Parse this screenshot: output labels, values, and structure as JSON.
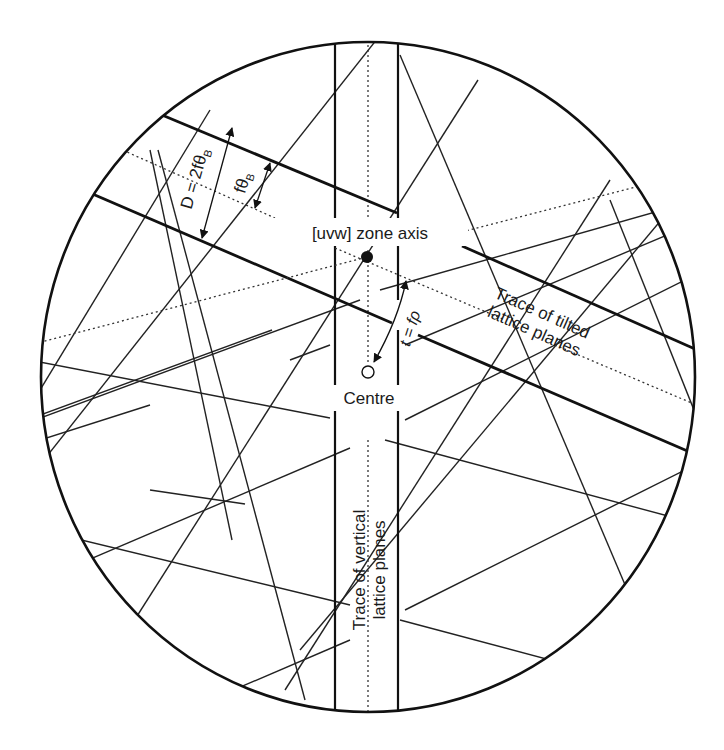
{
  "figure": {
    "type": "Kikuchi pattern schematic",
    "labels": {
      "zone_axis": "[uvw] zone axis",
      "centre": "Centre",
      "tilted_trace_line1": "Trace of tilted",
      "tilted_trace_line2": "lattice planes",
      "vertical_trace_line1": "Trace of vertical",
      "vertical_trace_line2": "lattice planes",
      "band_width": "D = 2fθ",
      "band_width_sub": "B",
      "half_width": "fθ",
      "half_width_sub": "B",
      "tilt": "t = fρ"
    },
    "colors": {
      "line": "#111111",
      "background": "#ffffff"
    },
    "geometry": {
      "screen_center": [
        368,
        377
      ],
      "screen_rx": 328,
      "screen_ry": 336,
      "zone_axis_point": [
        367,
        257
      ],
      "centre_point": [
        368,
        372
      ]
    }
  }
}
